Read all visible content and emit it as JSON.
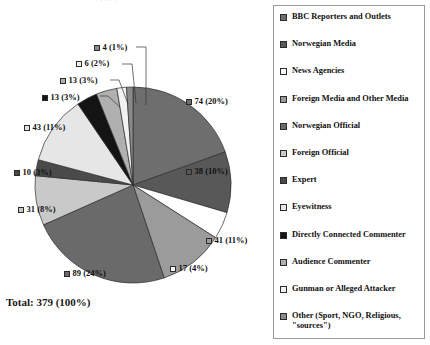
{
  "title_fragment": "· ·   · ·  ·",
  "total": "Total: 379 (100%)",
  "legend": {
    "items": [
      {
        "label": "BBC Reporters and Outlets",
        "swatch": "#6e6e6e"
      },
      {
        "label": "Norwegian Media",
        "swatch": "#585858"
      },
      {
        "label": "News Agencies",
        "swatch": "#ffffff"
      },
      {
        "label": "Foreign Media and Other Media",
        "swatch": "#9b9b9b"
      },
      {
        "label": "Norwegian Official",
        "swatch": "#6a6a6a"
      },
      {
        "label": "Foreign Official",
        "swatch": "#c9c9c9"
      },
      {
        "label": "Expert",
        "swatch": "#4a4a4a"
      },
      {
        "label": "Eyewitness",
        "swatch": "#e6e6e6"
      },
      {
        "label": "Directly Connected Commenter",
        "swatch": "#141414"
      },
      {
        "label": "Audience Commenter",
        "swatch": "#b0b0b0"
      },
      {
        "label": "Gunman or Alleged Attacker",
        "swatch": "#f2f2f2"
      },
      {
        "label": "Other (Sport, NGO, Religious, \"sources\")",
        "swatch": "#8a8a8a"
      }
    ]
  },
  "chart_data": {
    "type": "pie",
    "title": "",
    "total": 379,
    "legend_position": "right",
    "labels": [
      "BBC Reporters and Outlets",
      "Norwegian Media",
      "News Agencies",
      "Foreign Media and Other Media",
      "Norwegian Official",
      "Foreign Official",
      "Expert",
      "Eyewitness",
      "Directly Connected Commenter",
      "Audience Commenter",
      "Gunman or Alleged Attacker",
      "Other (Sport, NGO, Religious, \"sources\")"
    ],
    "values": [
      74,
      38,
      17,
      41,
      89,
      31,
      10,
      43,
      13,
      13,
      6,
      4
    ],
    "percents": [
      20,
      10,
      4,
      11,
      24,
      8,
      3,
      11,
      3,
      3,
      2,
      1
    ],
    "colors": [
      "#6e6e6e",
      "#585858",
      "#ffffff",
      "#9b9b9b",
      "#6a6a6a",
      "#c9c9c9",
      "#4a4a4a",
      "#e6e6e6",
      "#141414",
      "#b0b0b0",
      "#f2f2f2",
      "#8a8a8a"
    ],
    "data_labels": [
      "74 (20%)",
      "38 (10%)",
      "17 (4%)",
      "41 (11%)",
      "89 (24%)",
      "31 (8%)",
      "10 (3%)",
      "43 (11%)",
      "13 (3%)",
      "13 (3%)",
      "6 (2%)",
      "4 (1%)"
    ]
  },
  "data_label_positions": [
    {
      "x": 186,
      "y": 96,
      "idx": 0
    },
    {
      "x": 186,
      "y": 166,
      "idx": 1
    },
    {
      "x": 170,
      "y": 263,
      "idx": 2
    },
    {
      "x": 206,
      "y": 235,
      "idx": 3
    },
    {
      "x": 64,
      "y": 268,
      "idx": 4
    },
    {
      "x": 18,
      "y": 204,
      "idx": 5
    },
    {
      "x": 14,
      "y": 167,
      "idx": 6
    },
    {
      "x": 24,
      "y": 122,
      "idx": 7
    },
    {
      "x": 42,
      "y": 92,
      "idx": 8
    },
    {
      "x": 60,
      "y": 75,
      "idx": 9
    },
    {
      "x": 76,
      "y": 58,
      "idx": 10
    },
    {
      "x": 94,
      "y": 42,
      "idx": 11
    }
  ]
}
